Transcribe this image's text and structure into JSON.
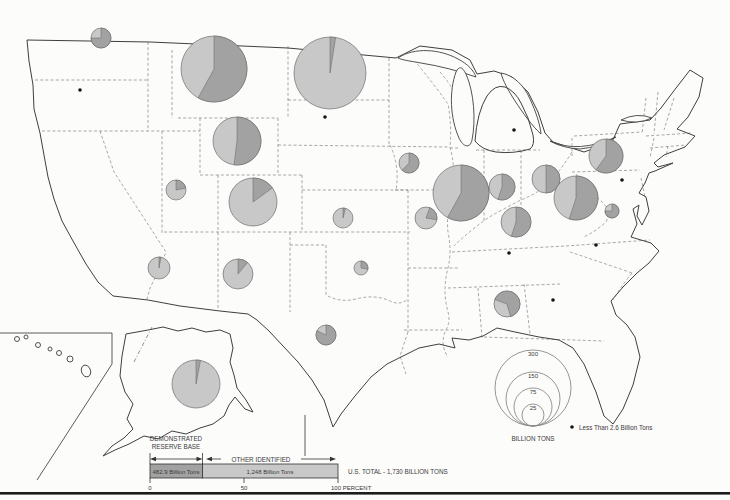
{
  "colors": {
    "demonstrated": "#a2a2a2",
    "other": "#c8c8c8",
    "pie_stroke": "#5a5a5a",
    "dot": "#141414",
    "map_line": "#3f3f3f",
    "state_line": "#828282"
  },
  "map": {
    "pies": [
      {
        "state": "washington",
        "cx": 101,
        "cy": 38,
        "r": 10,
        "demonstrated_fraction": 0.75,
        "rotation": 0
      },
      {
        "state": "montana",
        "cx": 214,
        "cy": 69,
        "r": 33,
        "demonstrated_fraction": 0.58,
        "rotation": 0
      },
      {
        "state": "north-dakota",
        "cx": 330,
        "cy": 73,
        "r": 36,
        "demonstrated_fraction": 0.025,
        "rotation": 0
      },
      {
        "state": "wyoming",
        "cx": 237,
        "cy": 141,
        "r": 24,
        "demonstrated_fraction": 0.52,
        "rotation": 0
      },
      {
        "state": "utah",
        "cx": 176,
        "cy": 190,
        "r": 10,
        "demonstrated_fraction": 0.22,
        "rotation": 0
      },
      {
        "state": "colorado",
        "cx": 253,
        "cy": 202,
        "r": 24,
        "demonstrated_fraction": 0.15,
        "rotation": 0
      },
      {
        "state": "arizona",
        "cx": 159,
        "cy": 268,
        "r": 11,
        "demonstrated_fraction": 0.03,
        "rotation": 0
      },
      {
        "state": "new-mexico",
        "cx": 238,
        "cy": 274,
        "r": 15,
        "demonstrated_fraction": 0.11,
        "rotation": 0
      },
      {
        "state": "kansas",
        "cx": 343,
        "cy": 218,
        "r": 10,
        "demonstrated_fraction": 0.04,
        "rotation": 0
      },
      {
        "state": "oklahoma",
        "cx": 361,
        "cy": 268,
        "r": 7,
        "demonstrated_fraction": 0.28,
        "rotation": 0
      },
      {
        "state": "texas",
        "cx": 326,
        "cy": 335,
        "r": 10,
        "demonstrated_fraction": 0.82,
        "rotation": 0
      },
      {
        "state": "iowa",
        "cx": 409,
        "cy": 163,
        "r": 10,
        "demonstrated_fraction": 0.62,
        "rotation": 0
      },
      {
        "state": "missouri",
        "cx": 426,
        "cy": 218,
        "r": 11,
        "demonstrated_fraction": 0.22,
        "rotation": 20
      },
      {
        "state": "illinois",
        "cx": 461,
        "cy": 193,
        "r": 28,
        "demonstrated_fraction": 0.58,
        "rotation": 0
      },
      {
        "state": "indiana",
        "cx": 502,
        "cy": 187,
        "r": 13,
        "demonstrated_fraction": 0.55,
        "rotation": 0
      },
      {
        "state": "ohio",
        "cx": 546,
        "cy": 179,
        "r": 14,
        "demonstrated_fraction": 0.5,
        "rotation": 0
      },
      {
        "state": "pennsylvania",
        "cx": 606,
        "cy": 156,
        "r": 17,
        "demonstrated_fraction": 0.6,
        "rotation": 0
      },
      {
        "state": "west-virginia",
        "cx": 576,
        "cy": 198,
        "r": 22,
        "demonstrated_fraction": 0.55,
        "rotation": 0
      },
      {
        "state": "virginia-maryland",
        "cx": 612,
        "cy": 211,
        "r": 7,
        "demonstrated_fraction": 0.75,
        "rotation": 0
      },
      {
        "state": "kentucky",
        "cx": 516,
        "cy": 222,
        "r": 15,
        "demonstrated_fraction": 0.55,
        "rotation": 0
      },
      {
        "state": "alabama",
        "cx": 507,
        "cy": 304,
        "r": 13,
        "demonstrated_fraction": 0.65,
        "rotation": -70
      },
      {
        "state": "alaska",
        "cx": 196,
        "cy": 384,
        "r": 24,
        "demonstrated_fraction": 0.03,
        "rotation": 0
      }
    ],
    "dots": [
      {
        "state": "oregon",
        "x": 80,
        "y": 90
      },
      {
        "state": "south-dakota",
        "x": 325,
        "y": 117
      },
      {
        "state": "michigan",
        "x": 514,
        "y": 130
      },
      {
        "state": "new-jersey",
        "x": 622,
        "y": 180
      },
      {
        "state": "tennessee",
        "x": 509,
        "y": 253
      },
      {
        "state": "north-carolina",
        "x": 596,
        "y": 245
      },
      {
        "state": "georgia",
        "x": 553,
        "y": 300
      }
    ]
  },
  "size_legend": {
    "title": "BILLION TONS",
    "entries": [
      {
        "value": "300",
        "r": 38
      },
      {
        "value": "150",
        "r": 27
      },
      {
        "value": "75",
        "r": 19
      },
      {
        "value": "25",
        "r": 11
      }
    ]
  },
  "dot_legend": {
    "label": "Less Than 2.6 Billion Tons"
  },
  "bar_legend": {
    "demonstrated": {
      "label_line1": "DEMONSTRATED",
      "label_line2": "RESERVE BASE",
      "value": "482.9 Billion Tons"
    },
    "other": {
      "label": "OTHER IDENTIFIED",
      "value": "1,248 Billion Tons"
    },
    "total": "U.S. TOTAL - 1,730 BILLION TONS",
    "scale_ticks": [
      "0",
      "50",
      "100 PERCENT"
    ]
  }
}
